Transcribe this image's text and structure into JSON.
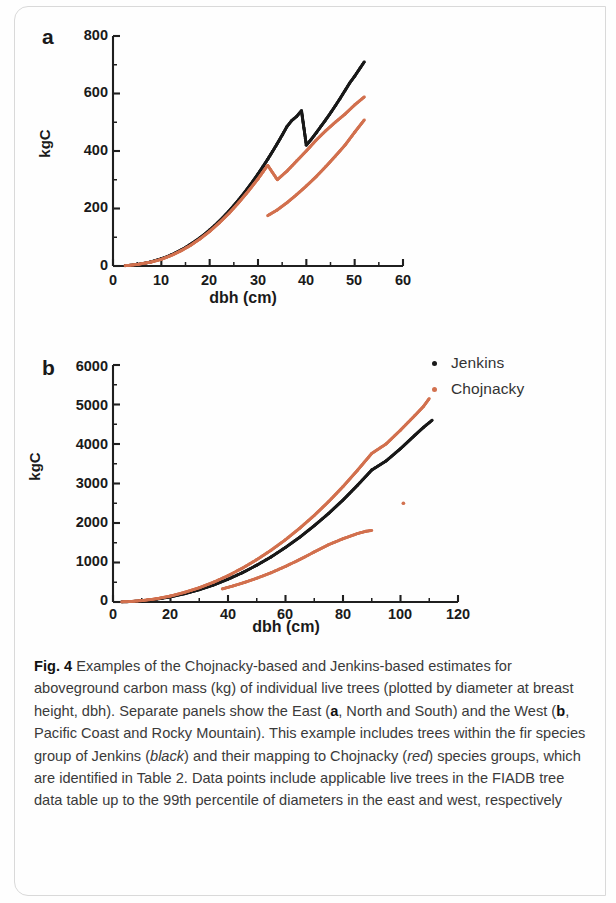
{
  "figure": {
    "label": "Fig. 4",
    "caption_parts": [
      {
        "text": "Fig. 4",
        "style": "bold"
      },
      {
        "text": " Examples of the Chojnacky-based and Jenkins-based estimates for aboveground carbon mass (kg) of individual live trees (plotted by diameter at breast height, dbh). Separate panels show the East (",
        "style": "normal"
      },
      {
        "text": "a",
        "style": "bold"
      },
      {
        "text": ", North and South) and the West (",
        "style": "normal"
      },
      {
        "text": "b",
        "style": "bold"
      },
      {
        "text": ", Pacific Coast and Rocky Mountain). This example includes trees within the fir species group of Jenkins (",
        "style": "normal"
      },
      {
        "text": "black",
        "style": "italic"
      },
      {
        "text": ") and their mapping to Chojnacky (",
        "style": "normal"
      },
      {
        "text": "red",
        "style": "italic"
      },
      {
        "text": ") species groups, which are identified in Table 2. Data points include applicable live trees in the FIADB tree data table up to the 99th percentile of diameters in the east and west, respectively",
        "style": "normal"
      }
    ],
    "caption_plain": "Fig. 4 Examples of the Chojnacky-based and Jenkins-based estimates for aboveground carbon mass (kg) of individual live trees (plotted by diameter at breast height, dbh). Separate panels show the East (a, North and South) and the West (b, Pacific Coast and Rocky Mountain). This example includes trees within the fir species group of Jenkins (black) and their mapping to Chojnacky (red) species groups, which are identified in Table 2. Data points include applicable live trees in the FIADB tree data table up to the 99th percentile of diameters in the east and west, respectively"
  },
  "legend": {
    "position": "top-right",
    "items": [
      {
        "label": "Jenkins",
        "color": "#1a1a1a"
      },
      {
        "label": "Chojnacky",
        "color": "#d2714f"
      }
    ]
  },
  "panels": {
    "a": {
      "letter": "a"
    },
    "b": {
      "letter": "b"
    }
  },
  "chart_data": [
    {
      "type": "scatter",
      "panel": "a",
      "title": "a",
      "subtitle": "East (North and South)",
      "xlabel": "dbh (cm)",
      "ylabel": "kgC",
      "xlim": [
        0,
        60
      ],
      "ylim": [
        0,
        800
      ],
      "xticks": [
        0,
        10,
        20,
        30,
        40,
        50,
        60
      ],
      "xticklabels": [
        "0",
        "10",
        "20",
        "30",
        "40",
        "50",
        "60"
      ],
      "yticks": [
        0,
        200,
        400,
        600,
        800
      ],
      "yticklabels": [
        "0",
        "200",
        "400",
        "600",
        "800"
      ],
      "minor_xticks": [
        5,
        15,
        25,
        35,
        45,
        55
      ],
      "minor_yticks": [
        100,
        300,
        500,
        700
      ],
      "grid": false,
      "legend_position": "outside-right-top",
      "series": [
        {
          "name": "Jenkins",
          "color": "#1a1a1a",
          "points": [
            [
              2.5,
              1
            ],
            [
              4,
              3
            ],
            [
              5,
              5
            ],
            [
              6,
              8
            ],
            [
              7,
              11
            ],
            [
              8,
              15
            ],
            [
              9,
              20
            ],
            [
              10,
              25
            ],
            [
              11,
              31
            ],
            [
              12,
              38
            ],
            [
              13,
              46
            ],
            [
              14,
              55
            ],
            [
              15,
              64
            ],
            [
              16,
              75
            ],
            [
              17,
              86
            ],
            [
              18,
              98
            ],
            [
              19,
              111
            ],
            [
              20,
              125
            ],
            [
              21,
              140
            ],
            [
              22,
              156
            ],
            [
              23,
              173
            ],
            [
              24,
              191
            ],
            [
              25,
              210
            ],
            [
              26,
              230
            ],
            [
              27,
              251
            ],
            [
              28,
              273
            ],
            [
              29,
              296
            ],
            [
              30,
              320
            ],
            [
              31,
              345
            ],
            [
              32,
              371
            ],
            [
              33,
              398
            ],
            [
              34,
              426
            ],
            [
              35,
              455
            ],
            [
              36,
              485
            ],
            [
              37,
              506
            ],
            [
              38,
              520
            ],
            [
              39,
              540
            ],
            [
              40,
              420
            ],
            [
              41,
              440
            ],
            [
              42,
              462
            ],
            [
              43,
              485
            ],
            [
              44,
              508
            ],
            [
              45,
              532
            ],
            [
              46,
              557
            ],
            [
              47,
              583
            ],
            [
              48,
              610
            ],
            [
              49,
              637
            ],
            [
              50,
              660
            ],
            [
              51,
              685
            ],
            [
              52,
              710
            ]
          ]
        },
        {
          "name": "Chojnacky",
          "color": "#d2714f",
          "branches": [
            {
              "name": "upper",
              "points": [
                [
                  2.5,
                  1
                ],
                [
                  5,
                  5
                ],
                [
                  8,
                  14
                ],
                [
                  10,
                  23
                ],
                [
                  12,
                  36
                ],
                [
                  14,
                  52
                ],
                [
                  16,
                  71
                ],
                [
                  18,
                  94
                ],
                [
                  20,
                  120
                ],
                [
                  22,
                  150
                ],
                [
                  24,
                  183
                ],
                [
                  26,
                  220
                ],
                [
                  28,
                  260
                ],
                [
                  30,
                  303
                ],
                [
                  32,
                  350
                ],
                [
                  34,
                  300
                ],
                [
                  36,
                  330
                ],
                [
                  38,
                  365
                ],
                [
                  40,
                  400
                ],
                [
                  42,
                  437
                ],
                [
                  44,
                  470
                ],
                [
                  46,
                  500
                ],
                [
                  48,
                  528
                ],
                [
                  50,
                  560
                ],
                [
                  52,
                  588
                ]
              ]
            },
            {
              "name": "lower",
              "points": [
                [
                  32,
                  175
                ],
                [
                  34,
                  195
                ],
                [
                  36,
                  220
                ],
                [
                  38,
                  248
                ],
                [
                  40,
                  278
                ],
                [
                  42,
                  310
                ],
                [
                  44,
                  345
                ],
                [
                  46,
                  382
                ],
                [
                  48,
                  420
                ],
                [
                  50,
                  465
                ],
                [
                  52,
                  508
                ]
              ]
            }
          ]
        }
      ]
    },
    {
      "type": "scatter",
      "panel": "b",
      "title": "b",
      "subtitle": "West (Pacific Coast and Rocky Mountain)",
      "xlabel": "dbh (cm)",
      "ylabel": "kgC",
      "xlim": [
        0,
        120
      ],
      "ylim": [
        0,
        6000
      ],
      "xticks": [
        0,
        20,
        40,
        60,
        80,
        100,
        120
      ],
      "xticklabels": [
        "0",
        "20",
        "40",
        "60",
        "80",
        "100",
        "120"
      ],
      "yticks": [
        0,
        1000,
        2000,
        3000,
        4000,
        5000,
        6000
      ],
      "yticklabels": [
        "0",
        "1000",
        "2000",
        "3000",
        "4000",
        "5000",
        "6000"
      ],
      "minor_xticks": [
        10,
        30,
        50,
        70,
        90,
        110
      ],
      "minor_yticks": [
        500,
        1500,
        2500,
        3500,
        4500,
        5500
      ],
      "grid": false,
      "legend_position": "outside-right-top",
      "series": [
        {
          "name": "Jenkins",
          "color": "#1a1a1a",
          "points": [
            [
              3,
              2
            ],
            [
              6,
              10
            ],
            [
              10,
              30
            ],
            [
              15,
              70
            ],
            [
              20,
              130
            ],
            [
              25,
              210
            ],
            [
              30,
              310
            ],
            [
              35,
              430
            ],
            [
              40,
              575
            ],
            [
              45,
              740
            ],
            [
              50,
              930
            ],
            [
              55,
              1140
            ],
            [
              60,
              1380
            ],
            [
              65,
              1640
            ],
            [
              70,
              1930
            ],
            [
              75,
              2240
            ],
            [
              80,
              2580
            ],
            [
              85,
              2950
            ],
            [
              90,
              3340
            ],
            [
              95,
              3570
            ],
            [
              100,
              3880
            ],
            [
              105,
              4220
            ],
            [
              108,
              4420
            ],
            [
              111,
              4600
            ]
          ]
        },
        {
          "name": "Chojnacky",
          "color": "#d2714f",
          "branches": [
            {
              "name": "upper",
              "points": [
                [
                  3,
                  2
                ],
                [
                  6,
                  12
                ],
                [
                  10,
                  34
                ],
                [
                  15,
                  80
                ],
                [
                  20,
                  150
                ],
                [
                  25,
                  245
                ],
                [
                  30,
                  360
                ],
                [
                  35,
                  500
                ],
                [
                  40,
                  665
                ],
                [
                  45,
                  855
                ],
                [
                  50,
                  1070
                ],
                [
                  55,
                  1310
                ],
                [
                  60,
                  1575
                ],
                [
                  65,
                  1870
                ],
                [
                  70,
                  2190
                ],
                [
                  75,
                  2540
                ],
                [
                  80,
                  2920
                ],
                [
                  85,
                  3330
                ],
                [
                  90,
                  3760
                ],
                [
                  95,
                  4000
                ],
                [
                  100,
                  4350
                ],
                [
                  105,
                  4720
                ],
                [
                  108,
                  4950
                ],
                [
                  110,
                  5150
                ]
              ]
            },
            {
              "name": "lower",
              "points": [
                [
                  38,
                  330
                ],
                [
                  42,
                  410
                ],
                [
                  46,
                  500
                ],
                [
                  50,
                  600
                ],
                [
                  55,
                  740
                ],
                [
                  60,
                  900
                ],
                [
                  65,
                  1075
                ],
                [
                  70,
                  1265
                ],
                [
                  75,
                  1450
                ],
                [
                  80,
                  1600
                ],
                [
                  85,
                  1730
                ],
                [
                  88,
                  1790
                ],
                [
                  90,
                  1810
                ]
              ]
            },
            {
              "name": "outlier",
              "points": [
                [
                  101,
                  2500
                ]
              ]
            }
          ]
        }
      ]
    }
  ]
}
